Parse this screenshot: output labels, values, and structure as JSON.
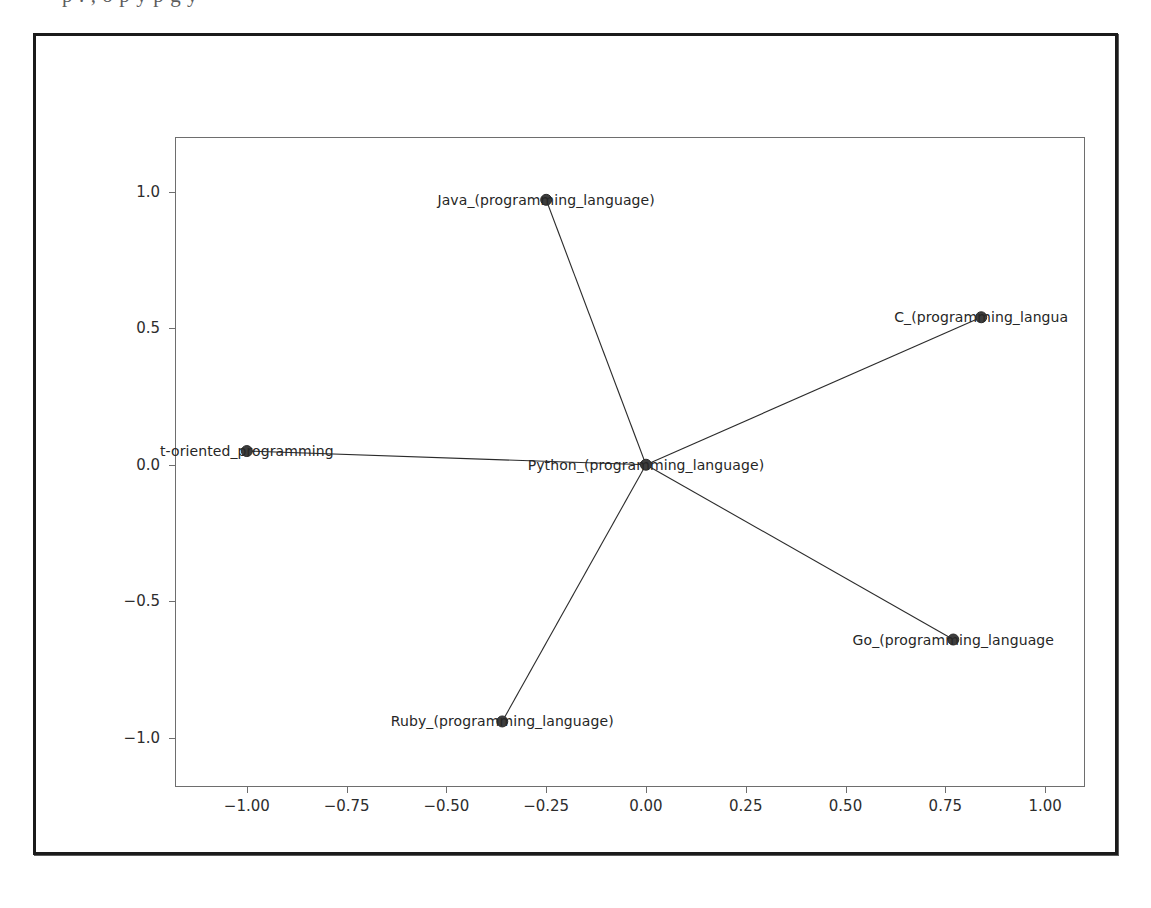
{
  "page": {
    "bleed_text": "p     .   ,  o  p                                y      p g               y"
  },
  "figure": {
    "background_color": "#ffffff",
    "frame_color": "#1b1b1b",
    "node_color": "#3d3d3d",
    "edge_color": "#2b2b2b"
  },
  "chart_data": {
    "type": "scatter",
    "title": "",
    "xlabel": "",
    "ylabel": "",
    "xlim": [
      -1.18,
      1.1
    ],
    "ylim": [
      -1.18,
      1.2
    ],
    "grid": false,
    "legend": null,
    "xticks": [
      "-1.00",
      "-0.75",
      "-0.50",
      "-0.25",
      "0.00",
      "0.25",
      "0.50",
      "0.75",
      "1.00"
    ],
    "xtick_values": [
      -1.0,
      -0.75,
      -0.5,
      -0.25,
      0.0,
      0.25,
      0.5,
      0.75,
      1.0
    ],
    "yticks": [
      "1.0",
      "0.5",
      "0.0",
      "-0.5",
      "-1.0"
    ],
    "ytick_values": [
      1.0,
      0.5,
      0.0,
      -0.5,
      -1.0
    ],
    "nodes": [
      {
        "id": "python",
        "label": "Python_(programming_language)",
        "x": 0.0,
        "y": 0.0
      },
      {
        "id": "java",
        "label": "Java_(programming_language)",
        "x": -0.25,
        "y": 0.97
      },
      {
        "id": "c",
        "label": "C_(programming_langua",
        "x": 0.84,
        "y": 0.54
      },
      {
        "id": "oop",
        "label": "t-oriented_programming",
        "x": -1.0,
        "y": 0.05
      },
      {
        "id": "go",
        "label": "Go_(programming_language",
        "x": 0.77,
        "y": -0.64
      },
      {
        "id": "ruby",
        "label": "Ruby_(programming_language)",
        "x": -0.36,
        "y": -0.94
      }
    ],
    "edges": [
      {
        "source": "python",
        "target": "java"
      },
      {
        "source": "python",
        "target": "c"
      },
      {
        "source": "python",
        "target": "oop"
      },
      {
        "source": "python",
        "target": "go"
      },
      {
        "source": "python",
        "target": "ruby"
      }
    ]
  }
}
